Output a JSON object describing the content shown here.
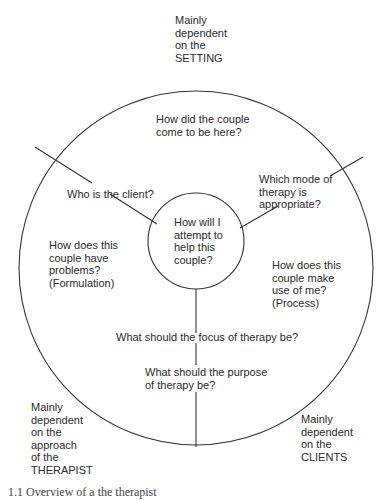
{
  "diagram": {
    "center_question": "How will I\nattempt to\nhelp this\ncouple?",
    "outer_labels": {
      "setting": "Mainly\ndependent\non the\nSETTING",
      "therapist": "Mainly\ndependent\non the\napproach\nof the\nTHERAPIST",
      "clients": "Mainly\ndependent\non the\nCLIENTS"
    },
    "questions": {
      "how_came_here": "How did the couple\ncome to be here?",
      "who_is_client": "Who is the client?",
      "which_mode": "Which mode of\ntherapy is\nappropriate?",
      "formulation": "How does this\ncouple have\nproblems?\n(Formulation)",
      "process": "How does this\ncouple make\nuse of me?\n(Process)",
      "focus": "What should the focus of therapy be?",
      "purpose": "What should the purpose\nof therapy be?"
    },
    "caption": "1.1  Overview of a the therapist"
  },
  "colors": {
    "line": "#333333",
    "text": "#2b2b2b",
    "background": "#ffffff"
  }
}
